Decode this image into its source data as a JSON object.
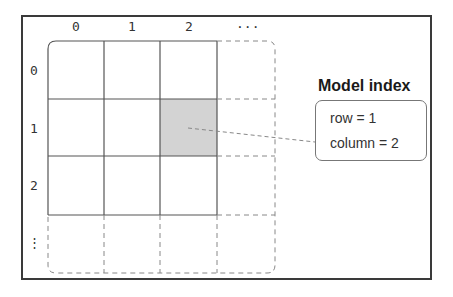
{
  "diagram": {
    "type": "model-index-grid",
    "column_labels": [
      "0",
      "1",
      "2",
      "..."
    ],
    "row_labels": [
      "0",
      "1",
      "2",
      "⋮"
    ],
    "highlighted_cell": {
      "row": 1,
      "column": 2
    },
    "colors": {
      "frame": "#3a3a3a",
      "grid_line": "#555555",
      "dashed_line": "#888888",
      "highlight_fill": "#d3d3d3"
    }
  },
  "model_index": {
    "title": "Model index",
    "row_text": "row = 1",
    "column_text": "column = 2"
  }
}
